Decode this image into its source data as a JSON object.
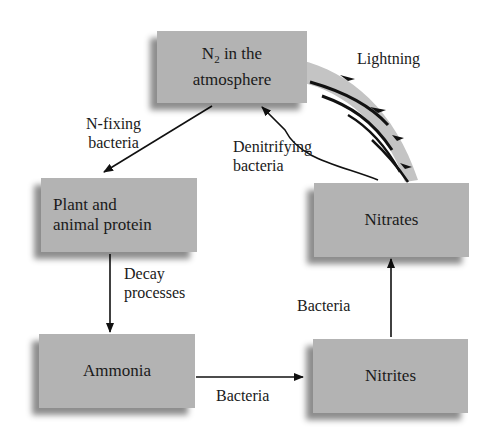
{
  "diagram": {
    "nodes": {
      "atmosphere": {
        "line1_prefix": "N",
        "line1_sub": "2",
        "line1_suffix": " in the",
        "line2": "atmosphere"
      },
      "protein": {
        "line1": "Plant and",
        "line2": "animal protein"
      },
      "ammonia": {
        "label": "Ammonia"
      },
      "nitrites": {
        "label": "Nitrites"
      },
      "nitrates": {
        "label": "Nitrates"
      }
    },
    "edges": {
      "n_fixing": {
        "line1": "N-fixing",
        "line2": "bacteria",
        "from": "atmosphere",
        "to": "protein"
      },
      "decay": {
        "line1": "Decay",
        "line2": "processes",
        "from": "protein",
        "to": "ammonia"
      },
      "bacteria_bottom": {
        "label": "Bacteria",
        "from": "ammonia",
        "to": "nitrites"
      },
      "bacteria_right": {
        "label": "Bacteria",
        "from": "nitrites",
        "to": "nitrates"
      },
      "denitrifying": {
        "line1": "Denitrifying",
        "line2": "bacteria",
        "from": "nitrates",
        "to": "atmosphere"
      },
      "lightning": {
        "label": "Lightning",
        "from": "atmosphere",
        "to": "nitrates"
      }
    },
    "colors": {
      "box": "#b3b3b3",
      "arrow": "#111111",
      "lightning_band": "#c4c4c4"
    }
  }
}
